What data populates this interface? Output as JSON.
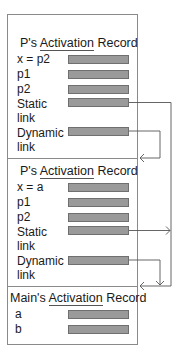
{
  "records": [
    {
      "title_prefix": "P's ",
      "title_underlined": "Activation",
      "title_suffix": " Record",
      "fields": [
        {
          "label": "x = p2"
        },
        {
          "label": "p1"
        },
        {
          "label": "p2"
        },
        {
          "label": "Static",
          "label2": "link"
        },
        {
          "label": "Dynamic",
          "label2": "link"
        }
      ]
    },
    {
      "title_prefix": "P's ",
      "title_underlined": "Activation",
      "title_suffix": " Record",
      "fields": [
        {
          "label": "x = a"
        },
        {
          "label": "p1"
        },
        {
          "label": "p2"
        },
        {
          "label": "Static",
          "label2": "link"
        },
        {
          "label": "Dynamic",
          "label2": "link"
        }
      ]
    },
    {
      "title_prefix": "Main's ",
      "title_underlined": "Activation",
      "title_suffix": " Record",
      "fields": [
        {
          "label": "a"
        },
        {
          "label": "b"
        }
      ]
    }
  ],
  "colors": {
    "field_fill": "#9a9a9a",
    "border": "#8a8a8a",
    "link_line": "#555555"
  }
}
